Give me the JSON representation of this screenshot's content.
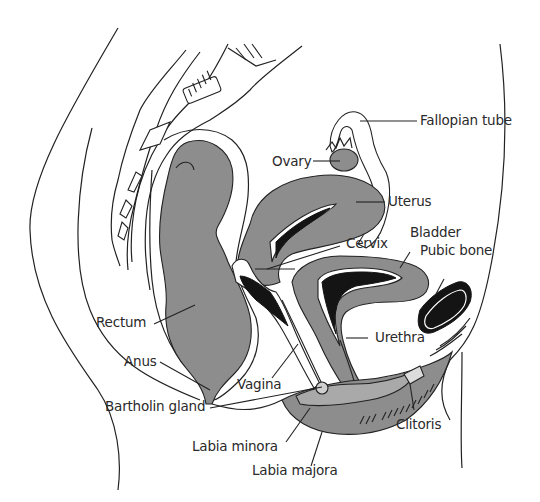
{
  "diagram": {
    "colors": {
      "organ_fill": "#8d8d8d",
      "organ_light_fill": "#a9a9a9",
      "dark_fill": "#141414",
      "line": "#222222",
      "label_text": "#2a2a2a",
      "background": "#ffffff"
    },
    "labels": [
      {
        "id": "fallopian-tube",
        "text": "Fallopian tube"
      },
      {
        "id": "ovary",
        "text": "Ovary"
      },
      {
        "id": "uterus",
        "text": "Uterus"
      },
      {
        "id": "bladder",
        "text": "Bladder"
      },
      {
        "id": "cervix",
        "text": "Cervix"
      },
      {
        "id": "pubic-bone",
        "text": "Pubic bone"
      },
      {
        "id": "rectum",
        "text": "Rectum"
      },
      {
        "id": "urethra",
        "text": "Urethra"
      },
      {
        "id": "anus",
        "text": "Anus"
      },
      {
        "id": "vagina",
        "text": "Vagina"
      },
      {
        "id": "bartholin-gland",
        "text": "Bartholin gland"
      },
      {
        "id": "clitoris",
        "text": "Clitoris"
      },
      {
        "id": "labia-minora",
        "text": "Labia minora"
      },
      {
        "id": "labia-majora",
        "text": "Labia majora"
      }
    ]
  }
}
